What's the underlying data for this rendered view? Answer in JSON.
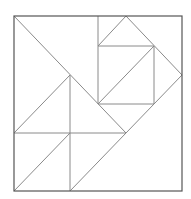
{
  "diagram": {
    "type": "tangram-square-dissection",
    "border": {
      "x1": 14,
      "y1": 16,
      "x2": 182,
      "y2": 191,
      "color": "#555555"
    },
    "line_color": "#8a8a8a",
    "segments": [
      {
        "name": "long-diagonal",
        "x1": 14,
        "y1": 16,
        "x2": 126,
        "y2": 133
      },
      {
        "name": "mid-horizontal",
        "x1": 14,
        "y1": 133,
        "x2": 126,
        "y2": 133
      },
      {
        "name": "left-vertical",
        "x1": 70,
        "y1": 75,
        "x2": 70,
        "y2": 191
      },
      {
        "name": "left-triangle-diagonal",
        "x1": 14,
        "y1": 133,
        "x2": 70,
        "y2": 75
      },
      {
        "name": "bottom-left-diagonal",
        "x1": 14,
        "y1": 191,
        "x2": 70,
        "y2": 133
      },
      {
        "name": "lower-right-diagonal",
        "x1": 70,
        "y1": 191,
        "x2": 182,
        "y2": 75
      },
      {
        "name": "upper-vertical",
        "x1": 98,
        "y1": 16,
        "x2": 98,
        "y2": 104
      },
      {
        "name": "square-top",
        "x1": 98,
        "y1": 46,
        "x2": 154,
        "y2": 46
      },
      {
        "name": "square-bottom",
        "x1": 98,
        "y1": 104,
        "x2": 154,
        "y2": 104
      },
      {
        "name": "square-right",
        "x1": 154,
        "y1": 46,
        "x2": 154,
        "y2": 104
      },
      {
        "name": "square-diagonal",
        "x1": 98,
        "y1": 104,
        "x2": 154,
        "y2": 46
      },
      {
        "name": "top-triangle-left",
        "x1": 98,
        "y1": 46,
        "x2": 126,
        "y2": 16
      },
      {
        "name": "top-triangle-right",
        "x1": 126,
        "y1": 16,
        "x2": 182,
        "y2": 75
      }
    ]
  }
}
